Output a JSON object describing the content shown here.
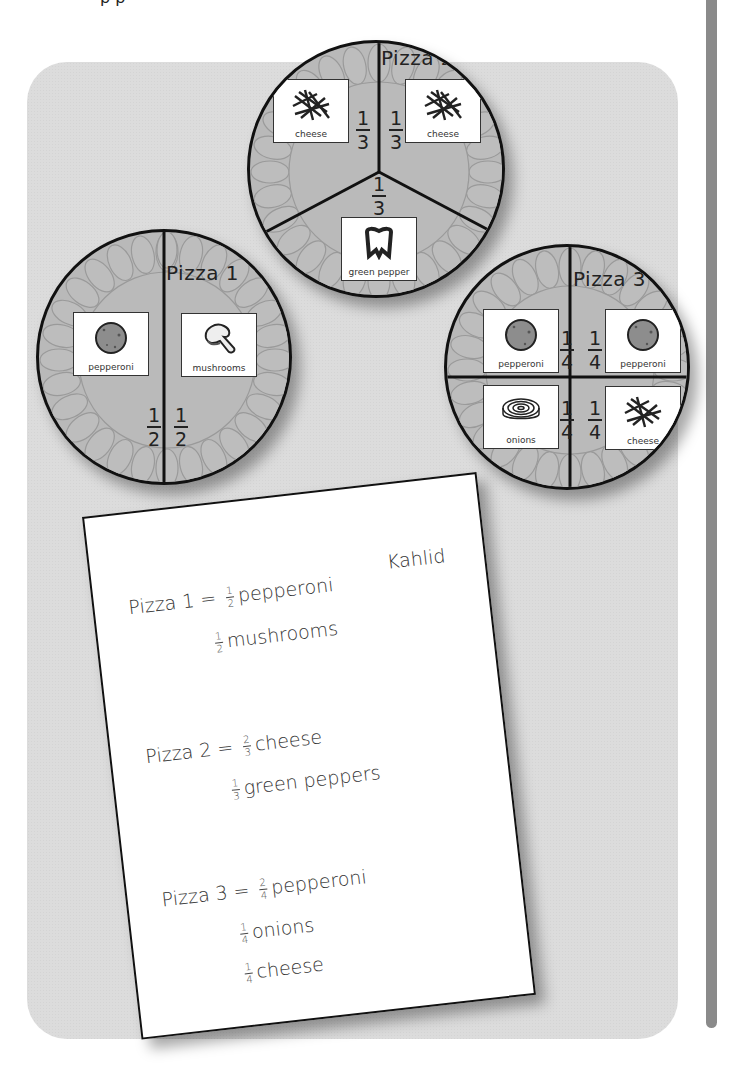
{
  "page": {
    "top_cut_text": "p            p"
  },
  "colors": {
    "panel": "#dcdcdc",
    "pizza": "#b9b9b9",
    "crust_lobes": "#a9a9a9",
    "margin_bar": "#8a8a8a",
    "outline": "#111111"
  },
  "pizzas": [
    {
      "title": "Pizza 1",
      "slices": [
        {
          "topping": "pepperoni",
          "icon": "pepperoni-icon",
          "numerator": "1",
          "denominator": "2"
        },
        {
          "topping": "mushrooms",
          "icon": "mushroom-icon",
          "numerator": "1",
          "denominator": "2"
        }
      ]
    },
    {
      "title": "Pizza 2",
      "slices": [
        {
          "topping": "cheese",
          "icon": "cheese-icon",
          "numerator": "1",
          "denominator": "3"
        },
        {
          "topping": "cheese",
          "icon": "cheese-icon",
          "numerator": "1",
          "denominator": "3"
        },
        {
          "topping": "green pepper",
          "icon": "green-pepper-icon",
          "numerator": "1",
          "denominator": "3"
        }
      ]
    },
    {
      "title": "Pizza 3",
      "slices": [
        {
          "topping": "pepperoni",
          "icon": "pepperoni-icon",
          "numerator": "1",
          "denominator": "4"
        },
        {
          "topping": "pepperoni",
          "icon": "pepperoni-icon",
          "numerator": "1",
          "denominator": "4"
        },
        {
          "topping": "onions",
          "icon": "onion-icon",
          "numerator": "1",
          "denominator": "4"
        },
        {
          "topping": "cheese",
          "icon": "cheese-icon",
          "numerator": "1",
          "denominator": "4"
        }
      ]
    }
  ],
  "worksheet": {
    "student_name": "Kahlid",
    "entries": [
      {
        "label": "Pizza 1",
        "equals": "=",
        "lines": [
          {
            "numerator": "1",
            "denominator": "2",
            "topping": "pepperoni"
          },
          {
            "numerator": "1",
            "denominator": "2",
            "topping": "mushrooms"
          }
        ]
      },
      {
        "label": "Pizza 2",
        "equals": "=",
        "lines": [
          {
            "numerator": "2",
            "denominator": "3",
            "topping": "cheese"
          },
          {
            "numerator": "1",
            "denominator": "3",
            "topping": "green peppers"
          }
        ]
      },
      {
        "label": "Pizza 3",
        "equals": "=",
        "lines": [
          {
            "numerator": "2",
            "denominator": "4",
            "topping": "pepperoni"
          },
          {
            "numerator": "1",
            "denominator": "4",
            "topping": "onions"
          },
          {
            "numerator": "1",
            "denominator": "4",
            "topping": "cheese"
          }
        ]
      }
    ]
  }
}
